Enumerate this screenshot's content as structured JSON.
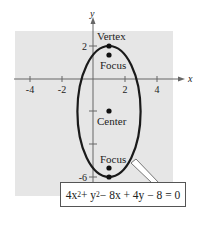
{
  "figure": {
    "axes": {
      "x_label": "x",
      "y_label": "y"
    },
    "x_ticks": [
      "-4",
      "-2",
      "2",
      "4"
    ],
    "y_ticks": [
      "2",
      "-6"
    ],
    "points": {
      "vertex_top": {
        "label": "Vertex",
        "x": 1,
        "y": 2
      },
      "focus_top": {
        "label": "Focus"
      },
      "center": {
        "label": "Center",
        "x": 1,
        "y": -2
      },
      "focus_bottom": {
        "label": "Focus"
      },
      "vertex_bottom": {
        "label": "Vertex",
        "x": 1,
        "y": -6
      }
    },
    "equation": {
      "t1": "4x",
      "e1": "2",
      "t2": " + y",
      "e2": "2",
      "t3": " − 8x + 4y − 8 = 0"
    },
    "colors": {
      "panel": "#e6e6e6",
      "curve": "#1a1a1a",
      "axis": "#555555"
    }
  }
}
